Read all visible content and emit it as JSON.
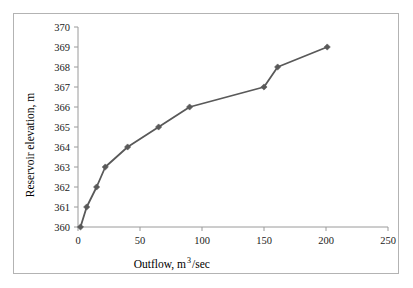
{
  "chart_data": {
    "type": "line",
    "title": "",
    "xlabel": "Outflow, m3/sec",
    "xlabel_base": "Outflow, m",
    "xlabel_sup": "3",
    "xlabel_tail": "/sec",
    "ylabel": "Reservoir elevation, m",
    "xlim": [
      0,
      250
    ],
    "ylim": [
      360,
      370
    ],
    "xticks": [
      0,
      50,
      100,
      150,
      200,
      250
    ],
    "yticks": [
      360,
      361,
      362,
      363,
      364,
      365,
      366,
      367,
      368,
      369,
      370
    ],
    "xtick_labels": [
      "0",
      "50",
      "100",
      "150",
      "200",
      "250"
    ],
    "ytick_labels": [
      "360",
      "361",
      "362",
      "363",
      "364",
      "365",
      "366",
      "367",
      "368",
      "369",
      "370"
    ],
    "grid": false,
    "legend": false,
    "legend_position": "none",
    "marker": "diamond",
    "series": [
      {
        "name": "Reservoir elevation vs outflow",
        "color": "#595959",
        "x": [
          2,
          7,
          15,
          22,
          40,
          65,
          90,
          150,
          161,
          201
        ],
        "y": [
          360,
          361,
          362,
          363,
          364,
          365,
          366,
          367,
          368,
          369
        ]
      }
    ],
    "points": [
      {
        "x": 2,
        "y": 360
      },
      {
        "x": 7,
        "y": 361
      },
      {
        "x": 15,
        "y": 362
      },
      {
        "x": 22,
        "y": 363
      },
      {
        "x": 40,
        "y": 364
      },
      {
        "x": 65,
        "y": 365
      },
      {
        "x": 90,
        "y": 366
      },
      {
        "x": 150,
        "y": 367
      },
      {
        "x": 161,
        "y": 368
      },
      {
        "x": 201,
        "y": 369
      }
    ]
  },
  "style": {
    "line_color": "#595959",
    "marker_color": "#595959",
    "axis_color": "#9a9a9a",
    "frame_color": "#b3b3b3",
    "text_color": "#1a1a1a",
    "background": "#ffffff"
  }
}
